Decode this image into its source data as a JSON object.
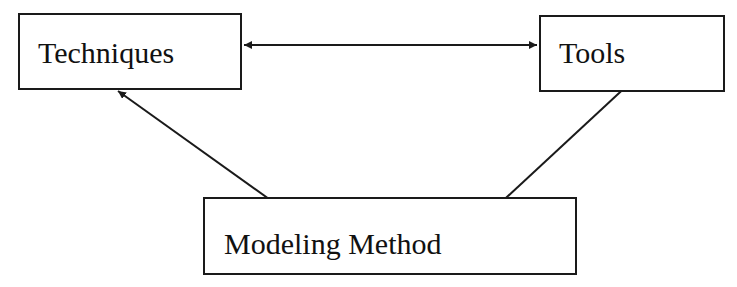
{
  "diagram": {
    "type": "concept-relationship",
    "nodes": [
      {
        "id": "techniques",
        "label": "Techniques"
      },
      {
        "id": "tools",
        "label": "Tools"
      },
      {
        "id": "modeling_method",
        "label": "Modeling Method"
      }
    ],
    "edges": [
      {
        "from": "techniques",
        "to": "tools",
        "direction": "bidirectional"
      },
      {
        "from": "techniques",
        "to": "modeling_method",
        "direction": "bidirectional"
      },
      {
        "from": "tools",
        "to": "modeling_method",
        "direction": "bidirectional"
      }
    ],
    "colors": {
      "stroke": "#1a1a1a",
      "background": "#ffffff",
      "text": "#111111"
    }
  }
}
